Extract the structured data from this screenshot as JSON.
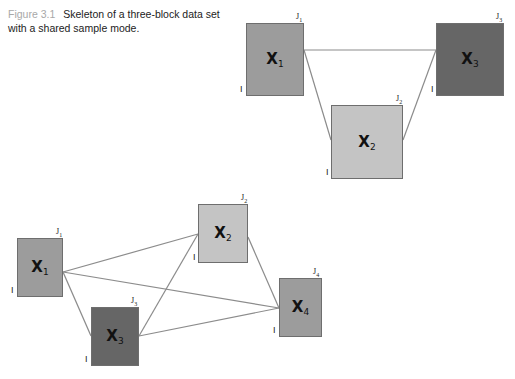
{
  "caption": {
    "figure_label": "Figure 3.1",
    "text_line1": "Skeleton of a three-block data set",
    "text_line2": "with a shared sample mode."
  },
  "colors": {
    "light_gray": "#c4c4c4",
    "mid_gray": "#9c9c9c",
    "dark_gray": "#666666",
    "link_line": "#8c8c8c"
  },
  "top_diagram": {
    "blocks": [
      {
        "id": "X1",
        "label": "X",
        "sub": "1",
        "row_dim": "I",
        "col_dim": "J",
        "col_sub": "1"
      },
      {
        "id": "X2",
        "label": "X",
        "sub": "2",
        "row_dim": "I",
        "col_dim": "J",
        "col_sub": "2"
      },
      {
        "id": "X3",
        "label": "X",
        "sub": "3",
        "row_dim": "I",
        "col_dim": "J",
        "col_sub": "3"
      }
    ],
    "links": [
      [
        "X1",
        "X3"
      ],
      [
        "X1",
        "X2"
      ],
      [
        "X2",
        "X3"
      ]
    ]
  },
  "bottom_diagram": {
    "blocks": [
      {
        "id": "X1",
        "label": "X",
        "sub": "1",
        "row_dim": "I",
        "col_dim": "J",
        "col_sub": "1"
      },
      {
        "id": "X2",
        "label": "X",
        "sub": "2",
        "row_dim": "I",
        "col_dim": "J",
        "col_sub": "2"
      },
      {
        "id": "X3",
        "label": "X",
        "sub": "3",
        "row_dim": "I",
        "col_dim": "J",
        "col_sub": "3"
      },
      {
        "id": "X4",
        "label": "X",
        "sub": "4",
        "row_dim": "I",
        "col_dim": "J",
        "col_sub": "4"
      }
    ],
    "links": [
      [
        "X1",
        "X2"
      ],
      [
        "X1",
        "X3"
      ],
      [
        "X1",
        "X4"
      ],
      [
        "X3",
        "X2"
      ],
      [
        "X3",
        "X4"
      ],
      [
        "X2",
        "X4"
      ]
    ]
  }
}
